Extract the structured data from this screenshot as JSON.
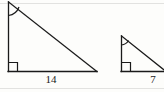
{
  "figure": {
    "background_color": "#fdfdfb",
    "stroke_color": "#1a1a1a",
    "label_color": "#1a1a1a",
    "canvas": {
      "width": 164,
      "height": 92
    },
    "shapes": [
      {
        "id": "left-triangle",
        "name": "large-right-triangle",
        "type": "right-triangle",
        "apex": {
          "x": 8,
          "y": 2
        },
        "right_angle_vertex": {
          "x": 8,
          "y": 71
        },
        "base_end": {
          "x": 97,
          "y": 71
        },
        "has_right_angle_marker": true,
        "has_angle_arc_marker": true,
        "base_label": "14"
      },
      {
        "id": "right-triangle",
        "name": "small-right-triangle",
        "type": "right-triangle",
        "apex": {
          "x": 121,
          "y": 36
        },
        "right_angle_vertex": {
          "x": 121,
          "y": 71
        },
        "base_end": {
          "x": 166,
          "y": 71
        },
        "hypotenuse_end": {
          "x": 166,
          "y": 63
        },
        "clipped_at_right_edge": true,
        "has_right_angle_marker": true,
        "has_angle_arc_marker": true,
        "base_label": "7"
      }
    ],
    "labels": {
      "left_base": "14",
      "right_base": "7"
    },
    "markers": {
      "right_angle_box_size": 9,
      "angle_arc_radius_left": 13,
      "angle_arc_radius_right": 9
    }
  }
}
